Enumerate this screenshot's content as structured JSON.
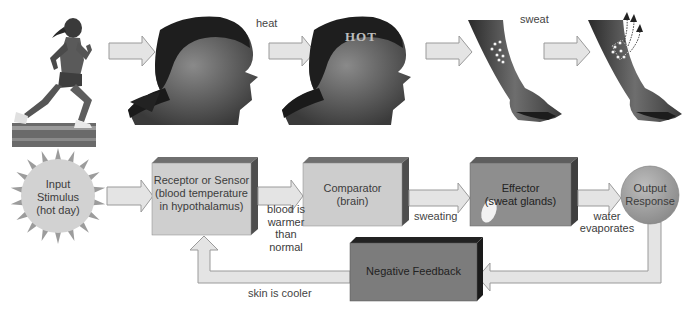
{
  "diagram": {
    "type": "negative-feedback-loop",
    "top_row": {
      "images": [
        {
          "name": "runner",
          "description": "woman running on track"
        },
        {
          "name": "head-normal",
          "description": "woman's head in profile"
        },
        {
          "name": "head-hot",
          "description": "woman's head in profile with HOT label",
          "overlay_text": "HOT"
        },
        {
          "name": "arm-sweat-glands",
          "description": "forearm with sweat glands"
        },
        {
          "name": "arm-evaporation",
          "description": "forearm with sweat evaporating"
        }
      ],
      "labels": {
        "heat": "heat",
        "sweat": "sweat"
      }
    },
    "nodes": {
      "input": {
        "line1": "Input",
        "line2": "Stimulus",
        "line3": "(hot day)"
      },
      "receptor": {
        "line1": "Receptor or Sensor",
        "line2": "(blood temperature",
        "line3": "in hypothalamus)"
      },
      "comparator": {
        "line1": "Comparator",
        "line2": "(brain)"
      },
      "effector": {
        "line1": "Effector",
        "line2": "(sweat glands)"
      },
      "output": {
        "line1": "Output",
        "line2": "Response"
      },
      "feedback": {
        "label": "Negative Feedback"
      }
    },
    "edge_labels": {
      "receptor_to_comparator": {
        "line1": "blood is",
        "line2": "warmer",
        "line3": "than normal"
      },
      "comparator_to_effector": "sweating",
      "effector_to_output": {
        "line1": "water",
        "line2": "evaporates"
      },
      "feedback_to_receptor": "skin is cooler"
    },
    "colors": {
      "arrow_fill": "#e4e4e4",
      "arrow_stroke": "#9a9a9a",
      "sun_fill": "#d2d2d2",
      "sun_rays": "#9c9c9c",
      "receptor_fill": "#cfcfcf",
      "comparator_fill": "#cdcdcd",
      "effector_fill": "#8e8e8e",
      "output_fill": "#a9a9a9",
      "feedback_fill": "#7c7c7c",
      "box_top": "#6f6f6f",
      "box_side": "#4e4e4e"
    }
  }
}
